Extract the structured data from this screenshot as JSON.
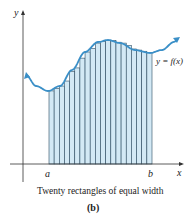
{
  "figure": {
    "caption": "Twenty rectangles of equal width",
    "sublabel": "(b)",
    "axis_labels": {
      "x": "x",
      "y": "y"
    },
    "interval_labels": {
      "a": "a",
      "b": "b"
    },
    "curve_label": "y = f(x)",
    "rectangle_count": 20,
    "colors": {
      "curve": "#3a8fc7",
      "rect_fill": "#d3e9f5",
      "rect_stroke": "#2a4a60",
      "axis": "#333333"
    }
  },
  "chart_data": {
    "type": "area",
    "title": "Twenty rectangles of equal width",
    "subtitle": "(b)",
    "xlabel": "x",
    "ylabel": "y",
    "function_label": "y = f(x)",
    "interval": [
      "a",
      "b"
    ],
    "rectangles": 20
  }
}
